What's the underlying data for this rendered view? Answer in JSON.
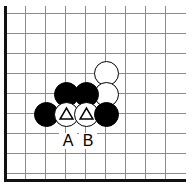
{
  "diagram": {
    "kind": "go-board-diagram",
    "width": 194,
    "height": 189,
    "background_color": "#ffffff",
    "grid": {
      "line_color": "#8c8c8c",
      "border_color": "#111111",
      "spacing_px": 20,
      "origin_x": 5,
      "origin_y": 13,
      "vertical_line_x": [
        5,
        25,
        45,
        65,
        85,
        105,
        125,
        145,
        165
      ],
      "horizontal_line_y": [
        13,
        33,
        53,
        73,
        93,
        113,
        133,
        153,
        173
      ],
      "left_border_x": 5,
      "bottom_border_y": 181,
      "line_right_end_x": 186,
      "line_top_end_y": 6,
      "line_bottom_end_y": 181
    },
    "stone_diameter": 25,
    "stones": [
      {
        "id": "w1",
        "color": "white",
        "cx": 106,
        "cy": 73,
        "marker": "none"
      },
      {
        "id": "w2",
        "color": "white",
        "cx": 106,
        "cy": 94,
        "marker": "none"
      },
      {
        "id": "b1",
        "color": "black",
        "cx": 66,
        "cy": 94,
        "marker": "none"
      },
      {
        "id": "b2",
        "color": "black",
        "cx": 86,
        "cy": 94,
        "marker": "none"
      },
      {
        "id": "b3",
        "color": "black",
        "cx": 46,
        "cy": 114,
        "marker": "none"
      },
      {
        "id": "w3",
        "color": "white",
        "cx": 66,
        "cy": 114,
        "marker": "triangle"
      },
      {
        "id": "w4",
        "color": "white",
        "cx": 86,
        "cy": 114,
        "marker": "triangle"
      },
      {
        "id": "b4",
        "color": "black",
        "cx": 106,
        "cy": 114,
        "marker": "none"
      }
    ],
    "labels": [
      {
        "id": "label-a",
        "text": "A",
        "cx": 67,
        "cy": 141
      },
      {
        "id": "label-b",
        "text": "B",
        "cx": 87,
        "cy": 141
      }
    ]
  }
}
